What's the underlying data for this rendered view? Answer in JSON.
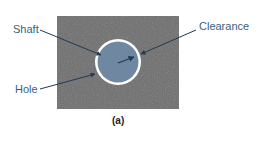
{
  "figure": {
    "caption": "(a)",
    "labels": {
      "shaft": "Shaft",
      "hole": "Hole",
      "clearance": "Clearance"
    }
  },
  "colors": {
    "plate": "#6e6e6e",
    "shaft": "#6f87a0",
    "clearance_gap": "#ffffff",
    "arrow": "#1f3a55",
    "label_text": "#3b5f7e"
  }
}
